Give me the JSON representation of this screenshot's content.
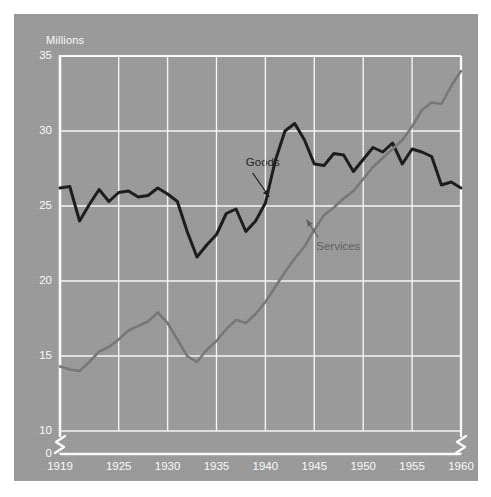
{
  "chart_data": {
    "type": "line",
    "title": "",
    "subtitle": "",
    "xlabel": "",
    "ylabel": "Millions",
    "xlim": [
      1919,
      1960
    ],
    "ylim": [
      10,
      35
    ],
    "y_axis_break": true,
    "y_axis_break_from": 0,
    "y_axis_break_to": 10,
    "x_axis_break_right": true,
    "grid": true,
    "legend_position": "inline-annotations",
    "background_color": "#9b9b9b",
    "grid_color": "#ffffff",
    "axis_color": "#ffffff",
    "tick_label_color": "#ffffff",
    "yticks": [
      0,
      10,
      15,
      20,
      25,
      30,
      35
    ],
    "ytick_labels": [
      "0",
      "10",
      "15",
      "20",
      "25",
      "30",
      "35"
    ],
    "xticks": [
      1919,
      1925,
      1930,
      1935,
      1940,
      1945,
      1950,
      1955,
      1960
    ],
    "xtick_labels": [
      "1919",
      "1925",
      "1930",
      "1935",
      "1940",
      "1945",
      "1950",
      "1955",
      "1960"
    ],
    "x": [
      1919,
      1920,
      1921,
      1922,
      1923,
      1924,
      1925,
      1926,
      1927,
      1928,
      1929,
      1930,
      1931,
      1932,
      1933,
      1934,
      1935,
      1936,
      1937,
      1938,
      1939,
      1940,
      1941,
      1942,
      1943,
      1944,
      1945,
      1946,
      1947,
      1948,
      1949,
      1950,
      1951,
      1952,
      1953,
      1954,
      1955,
      1956,
      1957,
      1958,
      1959,
      1960
    ],
    "series": [
      {
        "name": "Goods",
        "color": "#181818",
        "label_color": "#1b1b1b",
        "annotation": "Goods",
        "values": [
          26.2,
          26.3,
          24.0,
          25.1,
          26.1,
          25.3,
          25.9,
          26.0,
          25.6,
          25.7,
          26.2,
          25.8,
          25.3,
          23.3,
          21.6,
          22.4,
          23.1,
          24.5,
          24.8,
          23.3,
          24.0,
          25.2,
          28.0,
          30.0,
          30.5,
          29.4,
          27.8,
          27.7,
          28.5,
          28.4,
          27.3,
          28.1,
          28.9,
          28.6,
          29.2,
          27.8,
          28.8,
          28.6,
          28.3,
          26.4,
          26.6,
          26.2
        ]
      },
      {
        "name": "Services",
        "color": "#777777",
        "label_color": "#5f5f5f",
        "annotation": "Services",
        "values": [
          14.3,
          14.1,
          14.0,
          14.6,
          15.3,
          15.6,
          16.1,
          16.7,
          17.0,
          17.3,
          17.9,
          17.2,
          16.1,
          15.0,
          14.6,
          15.4,
          16.0,
          16.8,
          17.4,
          17.2,
          17.8,
          18.6,
          19.6,
          20.6,
          21.5,
          22.3,
          23.4,
          24.4,
          24.9,
          25.5,
          26.0,
          26.8,
          27.6,
          28.2,
          28.8,
          29.4,
          30.3,
          31.4,
          31.9,
          31.8,
          33.0,
          34.0
        ]
      }
    ],
    "annotations": [
      {
        "text": "Goods",
        "text_x": 1938.0,
        "text_y": 27.8,
        "arrow_from_x": 1938.7,
        "arrow_from_y": 27.2,
        "arrow_to_x": 1940.4,
        "arrow_to_y": 25.6,
        "color": "#1b1b1b"
      },
      {
        "text": "Services",
        "text_x": 1945.2,
        "text_y": 22.2,
        "arrow_from_x": 1945.4,
        "arrow_from_y": 22.9,
        "arrow_to_x": 1944.2,
        "arrow_to_y": 24.1,
        "color": "#5f5f5f"
      }
    ]
  }
}
